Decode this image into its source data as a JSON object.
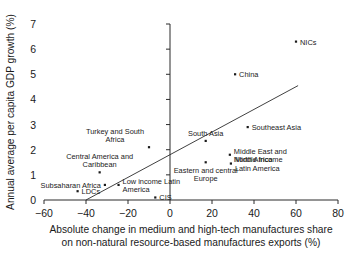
{
  "chart_data": {
    "type": "scatter",
    "title": "",
    "xlabel": "Absolute change in medium and high-tech manufactures share on non-natural resource-based manufactures exports (%)",
    "xlabel_line1": "Absolute change in medium and high-tech manufactures share",
    "xlabel_line2": "on non-natural resource-based manufactures exports (%)",
    "ylabel": "Annual average per capita GDP growth (%)",
    "xlim": [
      -60,
      80
    ],
    "ylim": [
      0,
      7
    ],
    "xticks": [
      -60,
      -40,
      -20,
      0,
      20,
      40,
      60,
      80
    ],
    "xtick_labels": [
      "−60",
      "−40",
      "−20",
      "0",
      "20",
      "40",
      "60",
      "80"
    ],
    "yticks": [
      0,
      1,
      2,
      3,
      4,
      5,
      6,
      7
    ],
    "ytick_labels": [
      "0",
      "1",
      "2",
      "3",
      "4",
      "5",
      "6",
      "7"
    ],
    "grid": false,
    "legend": "none",
    "points": [
      {
        "name": "NICs",
        "x": 60,
        "y": 6.3,
        "label": "NICs",
        "label_pos": "right",
        "label_lines": [
          "NICs"
        ]
      },
      {
        "name": "China",
        "x": 31,
        "y": 5.0,
        "label": "China",
        "label_pos": "right",
        "label_lines": [
          "China"
        ]
      },
      {
        "name": "Southeast Asia",
        "x": 37,
        "y": 2.9,
        "label": "Southeast Asia",
        "label_pos": "right",
        "label_lines": [
          "Southeast Asia"
        ]
      },
      {
        "name": "South Asia",
        "x": 17,
        "y": 2.35,
        "label": "South Asia",
        "label_pos": "above",
        "label_lines": [
          "South Asia"
        ]
      },
      {
        "name": "Middle East and North Africa",
        "x": 28.5,
        "y": 1.8,
        "label": "Middle East and North Africa",
        "label_pos": "right",
        "label_lines": [
          "Middle East and",
          "North Africa"
        ]
      },
      {
        "name": "Middle income Latin America",
        "x": 29,
        "y": 1.45,
        "label": "Middle income Latin America",
        "label_pos": "right",
        "label_lines": [
          "Middle income",
          "Latin America"
        ]
      },
      {
        "name": "Eastern and central Europe",
        "x": 17,
        "y": 1.5,
        "label": "Eastern and central Europe",
        "label_pos": "below",
        "label_lines": [
          "Eastern and central",
          "Europe"
        ]
      },
      {
        "name": "Turkey and South Africa",
        "x": -10,
        "y": 2.1,
        "label": "Turkey and South Africa",
        "label_pos": "above-left",
        "label_lines": [
          "Turkey and South",
          "Africa"
        ]
      },
      {
        "name": "Central America and Caribbean",
        "x": -33.5,
        "y": 1.1,
        "label": "Central America and Caribbean",
        "label_pos": "above",
        "label_lines": [
          "Central America and",
          "Caribbean"
        ]
      },
      {
        "name": "Subsaharan Africa",
        "x": -31,
        "y": 0.6,
        "label": "Subsaharan Africa",
        "label_pos": "left",
        "label_lines": [
          "Subsaharan Africa"
        ]
      },
      {
        "name": "LDCs",
        "x": -44,
        "y": 0.35,
        "label": "LDCs",
        "label_pos": "right",
        "label_lines": [
          "LDCs"
        ]
      },
      {
        "name": "Low income Latin America",
        "x": -24.5,
        "y": 0.6,
        "label": "Low income Latin America",
        "label_pos": "right",
        "label_lines": [
          "Low income Latin",
          "America"
        ]
      },
      {
        "name": "CIS",
        "x": -7,
        "y": 0.1,
        "label": "CIS",
        "label_pos": "right",
        "label_lines": [
          "CIS"
        ]
      }
    ],
    "trend_line": {
      "x0": -40,
      "y0": 0.0,
      "x1": 61,
      "y1": 4.55
    }
  },
  "caption": {
    "text": ""
  }
}
